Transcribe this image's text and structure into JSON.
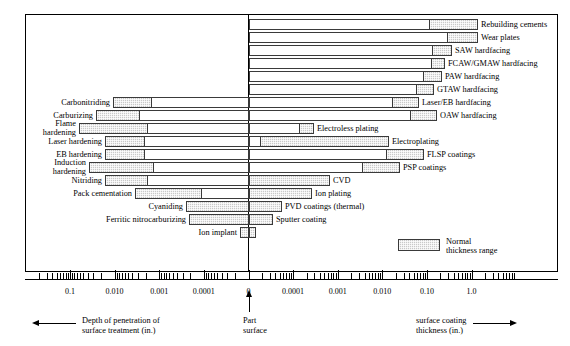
{
  "figure": {
    "legend_label_line1": "Normal",
    "legend_label_line2": "thickness range",
    "caption_left_line1": "Depth of penetration of",
    "caption_left_line2": "surface treatment (in.)",
    "caption_center_line1": "Part",
    "caption_center_line2": "surface",
    "caption_right_line1": "surface coating",
    "caption_right_line2": "thickness (in.)"
  },
  "chart_data": {
    "type": "bar",
    "title": "",
    "xlabel": "Depth of penetration of surface treatment (in.) / surface coating thickness (in.)",
    "ylabel": "",
    "scale": "log (mirrored about part surface)",
    "grid": false,
    "legend_position": "inside-bottom-right",
    "axis": {
      "left_tick_labels": [
        "0.1",
        "0.010",
        "0.001",
        "0.0001",
        "0"
      ],
      "right_tick_labels": [
        "0",
        "0.0001",
        "0.001",
        "0.010",
        "0.10",
        "1.0"
      ],
      "center_label": "0",
      "decades_left": 5,
      "decades_right": 6
    },
    "left_side_label": "Depth of penetration of surface treatment (in.)",
    "right_side_label": "surface coating thickness (in.)",
    "left_processes": [
      {
        "label": "Carbonitriding",
        "full_min_in": 0.0004,
        "full_max_in": 0.05,
        "normal_min_in": 0.005,
        "normal_max_in": 0.05
      },
      {
        "label": "Carburizing",
        "full_min_in": 0.001,
        "full_max_in": 0.12,
        "normal_min_in": 0.008,
        "normal_max_in": 0.12
      },
      {
        "label": "Flame\nhardening",
        "full_min_in": 0.0016,
        "full_max_in": 0.3,
        "normal_min_in": 0.03,
        "normal_max_in": 0.3
      },
      {
        "label": "Laser hardening",
        "full_min_in": 0.0006,
        "full_max_in": 0.04,
        "normal_min_in": 0.0035,
        "normal_max_in": 0.04
      },
      {
        "label": "EB hardening",
        "full_min_in": 0.0006,
        "full_max_in": 0.04,
        "normal_min_in": 0.0035,
        "normal_max_in": 0.04
      },
      {
        "label": "Induction\nhardening",
        "full_min_in": 0.0009,
        "full_max_in": 0.3,
        "normal_min_in": 0.012,
        "normal_max_in": 0.3
      },
      {
        "label": "Nitriding",
        "full_min_in": 0.0006,
        "full_max_in": 0.035,
        "normal_min_in": 0.005,
        "normal_max_in": 0.035
      },
      {
        "label": "Pack cementation",
        "full_min_in": 8e-05,
        "full_max_in": 0.012,
        "normal_min_in": 0.0006,
        "normal_max_in": 0.012
      },
      {
        "label": "Cyaniding",
        "full_min_in": 0.0,
        "full_max_in": 0.0035,
        "normal_min_in": 0.0,
        "normal_max_in": 0.0035
      },
      {
        "label": "Ferritic nitrocarburizing",
        "full_min_in": 0.0,
        "full_max_in": 0.003,
        "normal_min_in": 0.0,
        "normal_max_in": 0.003
      },
      {
        "label": "Ion implant",
        "full_min_in": 0.0,
        "full_max_in": 4e-05,
        "normal_min_in": 0.0,
        "normal_max_in": 4e-05
      }
    ],
    "right_processes": [
      {
        "label": "Rebuilding cements",
        "full_min_in": 0.0,
        "full_max_in": 0.9,
        "normal_min_in": 0.09,
        "normal_max_in": 0.9
      },
      {
        "label": "Wear plates",
        "full_min_in": 0.0,
        "full_max_in": 0.9,
        "normal_min_in": 0.3,
        "normal_max_in": 0.9
      },
      {
        "label": "SAW hardfacing",
        "full_min_in": 0.0,
        "full_max_in": 0.3,
        "normal_min_in": 0.13,
        "normal_max_in": 0.3
      },
      {
        "label": "FCAW/GMAW hardfacing",
        "full_min_in": 0.0,
        "full_max_in": 0.22,
        "normal_min_in": 0.13,
        "normal_max_in": 0.22
      },
      {
        "label": "PAW hardfacing",
        "full_min_in": 0.0,
        "full_max_in": 0.2,
        "normal_min_in": 0.085,
        "normal_max_in": 0.2
      },
      {
        "label": "GTAW hardfacing",
        "full_min_in": 0.0,
        "full_max_in": 0.16,
        "normal_min_in": 0.06,
        "normal_max_in": 0.16
      },
      {
        "label": "Laser/EB hardfacing",
        "full_min_in": 0.0,
        "full_max_in": 0.09,
        "normal_min_in": 0.02,
        "normal_max_in": 0.09
      },
      {
        "label": "OAW hardfacing",
        "full_min_in": 0.0,
        "full_max_in": 0.18,
        "normal_min_in": 0.07,
        "normal_max_in": 0.18
      },
      {
        "label": "Electroless plating",
        "full_min_in": 0.0,
        "full_max_in": 0.0035,
        "normal_min_in": 0.0004,
        "normal_max_in": 0.0035
      },
      {
        "label": "Electroplating",
        "full_min_in": 0.0,
        "full_max_in": 0.016,
        "normal_min_in": 3e-05,
        "normal_max_in": 0.016
      },
      {
        "label": "FLSP coatings",
        "full_min_in": 0.0,
        "full_max_in": 0.08,
        "normal_min_in": 0.011,
        "normal_max_in": 0.08
      },
      {
        "label": "PSP coatings",
        "full_min_in": 0.0,
        "full_max_in": 0.03,
        "normal_min_in": 0.0035,
        "normal_max_in": 0.03
      },
      {
        "label": "CVD",
        "full_min_in": 0.0,
        "full_max_in": 0.0009,
        "normal_min_in": 0.0,
        "normal_max_in": 0.0009
      },
      {
        "label": "Ion plating",
        "full_min_in": 0.0,
        "full_max_in": 0.0005,
        "normal_min_in": 0.0,
        "normal_max_in": 0.0005
      },
      {
        "label": "PVD coatings (thermal)",
        "full_min_in": 0.0,
        "full_max_in": 0.00022,
        "normal_min_in": 0.0,
        "normal_max_in": 0.00022
      },
      {
        "label": "Sputter coating",
        "full_min_in": 0.0,
        "full_max_in": 0.00012,
        "normal_min_in": 0.0,
        "normal_max_in": 0.00012
      }
    ]
  },
  "rows": [
    {
      "id": "rebuilding-cements",
      "y": 19,
      "left": {
        "label": "",
        "x1": null,
        "x2": null,
        "sx1": null,
        "sx2": null
      },
      "right": {
        "label": "Rebuilding cements",
        "x1": 249,
        "x2": 478,
        "sx1": 429,
        "sx2": 478
      },
      "label_x": 481
    },
    {
      "id": "wear-plates",
      "y": 32,
      "left": {
        "label": "",
        "x1": null,
        "x2": null,
        "sx1": null,
        "sx2": null
      },
      "right": {
        "label": "Wear plates",
        "x1": 249,
        "x2": 478,
        "sx1": 447,
        "sx2": 478
      },
      "label_x": 481
    },
    {
      "id": "saw-hardfacing",
      "y": 45,
      "left": {
        "label": "",
        "x1": null,
        "x2": null,
        "sx1": null,
        "sx2": null
      },
      "right": {
        "label": "SAW hardfacing",
        "x1": 249,
        "x2": 452,
        "sx1": 432,
        "sx2": 452
      },
      "label_x": 455
    },
    {
      "id": "fcaw-gmaw-hardfacing",
      "y": 58,
      "left": {
        "label": "",
        "x1": null,
        "x2": null,
        "sx1": null,
        "sx2": null
      },
      "right": {
        "label": "FCAW/GMAW hardfacing",
        "x1": 249,
        "x2": 445,
        "sx1": 431,
        "sx2": 445
      },
      "label_x": 448
    },
    {
      "id": "paw-hardfacing",
      "y": 71,
      "left": {
        "label": "",
        "x1": null,
        "x2": null,
        "sx1": null,
        "sx2": null
      },
      "right": {
        "label": "PAW hardfacing",
        "x1": 249,
        "x2": 442,
        "sx1": 423,
        "sx2": 442
      },
      "label_x": 445
    },
    {
      "id": "gtaw-hardfacing",
      "y": 84,
      "left": {
        "label": "",
        "x1": null,
        "x2": null,
        "sx1": null,
        "sx2": null
      },
      "right": {
        "label": "GTAW hardfacing",
        "x1": 249,
        "x2": 434,
        "sx1": 416,
        "sx2": 434
      },
      "label_x": 437
    },
    {
      "id": "laser-eb-hardfacing",
      "y": 97,
      "left": {
        "label": "Carbonitriding",
        "x1": 113,
        "x2": 249,
        "sx1": 113,
        "sx2": 152
      },
      "right": {
        "label": "Laser/EB hardfacing",
        "x1": 249,
        "x2": 419,
        "sx1": 392,
        "sx2": 419
      },
      "label_x": 422
    },
    {
      "id": "oaw-hardfacing",
      "y": 110,
      "left": {
        "label": "Carburizing",
        "x1": 96,
        "x2": 249,
        "sx1": 96,
        "sx2": 140
      },
      "right": {
        "label": "OAW hardfacing",
        "x1": 249,
        "x2": 437,
        "sx1": 410,
        "sx2": 437
      },
      "label_x": 440
    },
    {
      "id": "electroless-plating",
      "y": 123,
      "left": {
        "label": "Flame\nhardening",
        "x1": 79,
        "x2": 249,
        "sx1": 79,
        "sx2": 148
      },
      "right": {
        "label": "Electroless plating",
        "x1": 249,
        "x2": 314,
        "sx1": 299,
        "sx2": 314
      },
      "label_x": 317
    },
    {
      "id": "electroplating",
      "y": 136,
      "left": {
        "label": "Laser hardening",
        "x1": 105,
        "x2": 249,
        "sx1": 105,
        "sx2": 145
      },
      "right": {
        "label": "Electroplating",
        "x1": 249,
        "x2": 389,
        "sx1": 260,
        "sx2": 389
      },
      "label_x": 392
    },
    {
      "id": "flsp-coatings",
      "y": 149,
      "left": {
        "label": "EB hardening",
        "x1": 105,
        "x2": 249,
        "sx1": 105,
        "sx2": 145
      },
      "right": {
        "label": "FLSP coatings",
        "x1": 249,
        "x2": 424,
        "sx1": 386,
        "sx2": 424
      },
      "label_x": 427
    },
    {
      "id": "psp-coatings",
      "y": 162,
      "left": {
        "label": "Induction\nhardening",
        "x1": 89,
        "x2": 249,
        "sx1": 89,
        "sx2": 154
      },
      "right": {
        "label": "PSP coatings",
        "x1": 249,
        "x2": 400,
        "sx1": 362,
        "sx2": 400
      },
      "label_x": 403
    },
    {
      "id": "cvd",
      "y": 175,
      "left": {
        "label": "Nitriding",
        "x1": 105,
        "x2": 249,
        "sx1": 105,
        "sx2": 148
      },
      "right": {
        "label": "CVD",
        "x1": 249,
        "x2": 330,
        "sx1": 249,
        "sx2": 330
      },
      "label_x": 333
    },
    {
      "id": "ion-plating",
      "y": 188,
      "left": {
        "label": "Pack cementation",
        "x1": 135,
        "x2": 249,
        "sx1": 135,
        "sx2": 202
      },
      "right": {
        "label": "Ion plating",
        "x1": 249,
        "x2": 312,
        "sx1": 249,
        "sx2": 312
      },
      "label_x": 315
    },
    {
      "id": "pvd-coatings-thermal",
      "y": 201,
      "left": {
        "label": "Cyaniding",
        "x1": 186,
        "x2": 249,
        "sx1": 186,
        "sx2": 249
      },
      "right": {
        "label": "PVD coatings (thermal)",
        "x1": 249,
        "x2": 282,
        "sx1": 249,
        "sx2": 282
      },
      "label_x": 285
    },
    {
      "id": "sputter-coating",
      "y": 214,
      "left": {
        "label": "Ferritic nitrocarburizing",
        "x1": 189,
        "x2": 249,
        "sx1": 189,
        "sx2": 249
      },
      "right": {
        "label": "Sputter coating",
        "x1": 249,
        "x2": 273,
        "sx1": 249,
        "sx2": 273
      },
      "label_x": 276
    },
    {
      "id": "ion-implant",
      "y": 227,
      "left": {
        "label": "Ion implant",
        "x1": 240,
        "x2": 249,
        "sx1": 240,
        "sx2": 249
      },
      "right": {
        "label": "",
        "x1": 249,
        "x2": 256,
        "sx1": 249,
        "sx2": 256
      },
      "label_x": null
    }
  ],
  "axis_ticks": [
    {
      "x": 70,
      "label": "0.1",
      "major": true
    },
    {
      "x": 114.6,
      "label": "0.010",
      "major": true
    },
    {
      "x": 159.2,
      "label": "0.001",
      "major": true
    },
    {
      "x": 203.8,
      "label": "0.0001",
      "major": true
    },
    {
      "x": 248.5,
      "label": "0",
      "major": true
    },
    {
      "x": 293.1,
      "label": "0.0001",
      "major": true
    },
    {
      "x": 337.7,
      "label": "0.001",
      "major": true
    },
    {
      "x": 382.3,
      "label": "0.010",
      "major": true
    },
    {
      "x": 426.9,
      "label": "0.10",
      "major": true
    },
    {
      "x": 471.5,
      "label": "1.0",
      "major": true
    }
  ]
}
